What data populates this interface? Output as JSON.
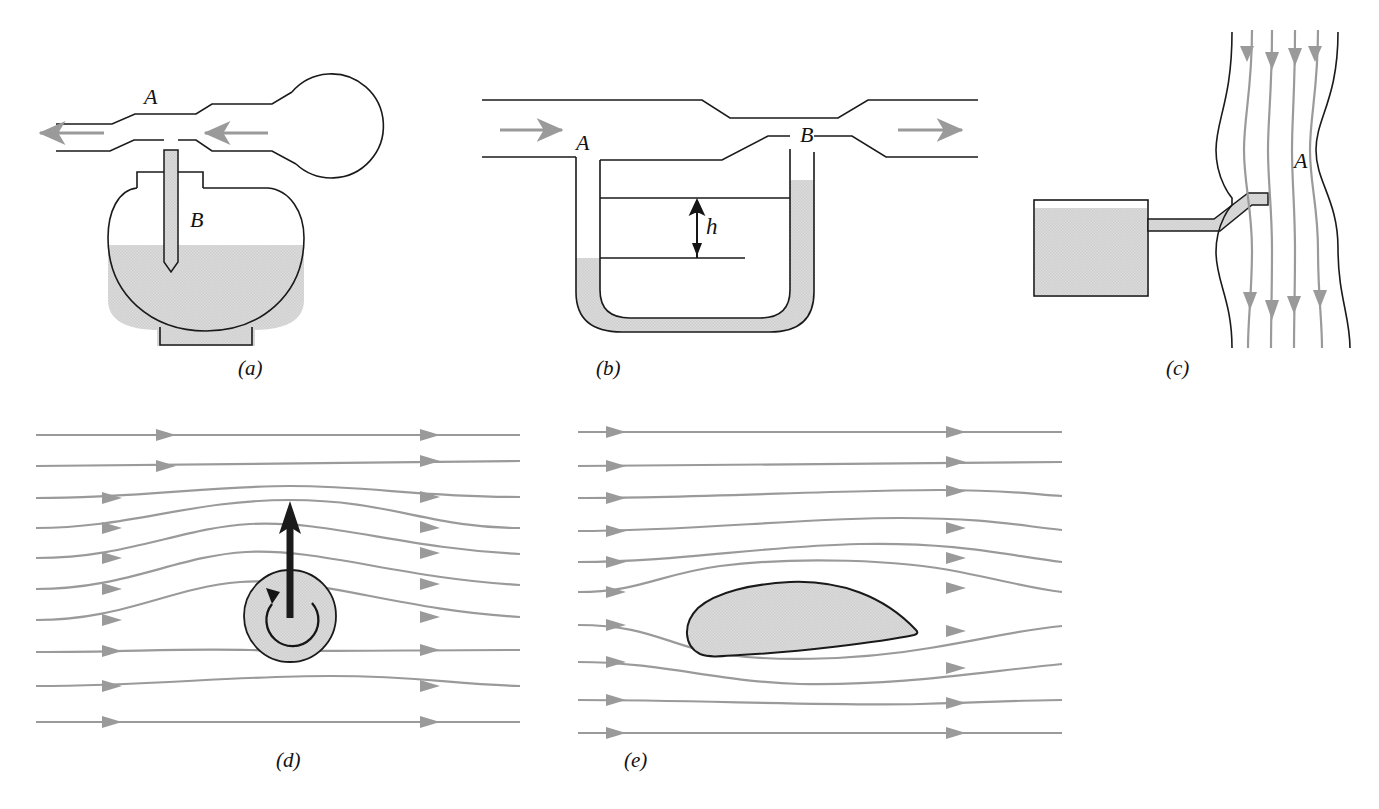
{
  "figure": {
    "background_color": "#ffffff",
    "ink_color": "#1a1a1a",
    "streamline_color": "#999999",
    "fluid_shade_color": "#d9d9d9",
    "arrow_gray": "#9a9a9a"
  },
  "panels": [
    {
      "id": "a",
      "label": "(a)",
      "label_x": 248,
      "label_y": 368,
      "description": "atomizer-with-squeeze-bulb",
      "annotations": [
        {
          "text": "A",
          "x": 151,
          "y": 98
        },
        {
          "text": "B",
          "x": 197,
          "y": 221
        }
      ],
      "flow_direction": "leftward"
    },
    {
      "id": "b",
      "label": "(b)",
      "label_x": 605,
      "label_y": 368,
      "description": "venturi-meter-with-u-tube-manometer",
      "annotations": [
        {
          "text": "A",
          "x": 583,
          "y": 143
        },
        {
          "text": "B",
          "x": 807,
          "y": 135
        },
        {
          "text": "h",
          "x": 705,
          "y": 215
        }
      ],
      "flow_direction": "rightward"
    },
    {
      "id": "c",
      "label": "(c)",
      "label_x": 1175,
      "label_y": 368,
      "description": "vertical-constricted-pipe-with-reservoir",
      "annotations": [
        {
          "text": "A",
          "x": 1301,
          "y": 160
        }
      ],
      "flow_direction": "downward"
    },
    {
      "id": "d",
      "label": "(d)",
      "label_x": 285,
      "label_y": 760,
      "description": "spinning-cylinder-magnus-effect",
      "annotations": [],
      "flow_direction": "rightward"
    },
    {
      "id": "e",
      "label": "(e)",
      "label_x": 633,
      "label_y": 760,
      "description": "airfoil-in-streamline-flow",
      "annotations": [],
      "flow_direction": "rightward"
    }
  ]
}
